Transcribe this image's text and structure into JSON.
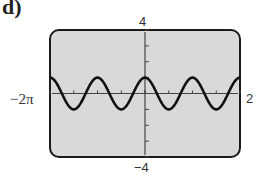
{
  "panel": {
    "label": "d)"
  },
  "window": {
    "xmin_label": "−2π",
    "xmax_label": "2",
    "ymax_label": "4",
    "ymin_label": "−4"
  },
  "colors": {
    "screen_bg": "#d9d9d9",
    "border": "#1a1a1a",
    "curve": "#111111",
    "axis": "#444444"
  },
  "chart_data": {
    "type": "line",
    "title": "",
    "function": "y = cos(2x)",
    "xlabel": "",
    "ylabel": "",
    "xlim": [
      -6.2832,
      6.2832
    ],
    "ylim": [
      -4,
      4
    ],
    "x_tick_step": 1.5708,
    "y_tick_step": 1,
    "tick_labels": {
      "x": [
        "−2π",
        "2π"
      ],
      "y": [
        "4",
        "−4"
      ]
    },
    "grid": false,
    "legend": null,
    "series": [
      {
        "name": "cos(2x)",
        "x": [
          -6.2832,
          -5.4978,
          -4.7124,
          -3.927,
          -3.1416,
          -2.3562,
          -1.5708,
          -0.7854,
          0,
          0.7854,
          1.5708,
          2.3562,
          3.1416,
          3.927,
          4.7124,
          5.4978,
          6.2832
        ],
        "values": [
          1,
          0,
          -1,
          0,
          1,
          0,
          -1,
          0,
          1,
          0,
          -1,
          0,
          1,
          0,
          -1,
          0,
          1
        ]
      }
    ]
  }
}
